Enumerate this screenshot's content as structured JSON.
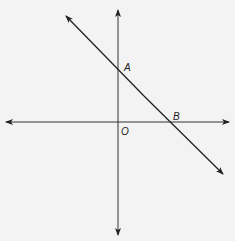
{
  "diagram": {
    "type": "coordinate-plane",
    "title": "",
    "axes": {
      "x": "horizontal axis with arrows both ends",
      "y": "vertical axis with arrows both ends"
    },
    "line": {
      "description": "line through A and B with negative slope, arrows both ends"
    },
    "points": [
      {
        "label": "A",
        "location": "y-intercept on positive y-axis"
      },
      {
        "label": "B",
        "location": "x-intercept on positive x-axis"
      },
      {
        "label": "O",
        "location": "origin"
      }
    ],
    "colors": {
      "stroke": "#222222",
      "background": "#f3f3f3"
    }
  }
}
